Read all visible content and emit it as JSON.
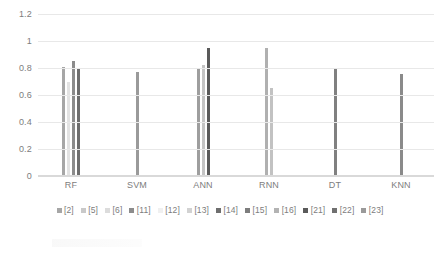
{
  "chart_data": {
    "type": "bar",
    "title": "",
    "subtitle": "",
    "xlabel": "",
    "ylabel": "",
    "categories": [
      "RF",
      "SVM",
      "ANN",
      "RNN",
      "DT",
      "KNN"
    ],
    "ylim": [
      0,
      1.2
    ],
    "yticks": [
      "0",
      "0.2",
      "0.4",
      "0.6",
      "0.8",
      "1",
      "1.2"
    ],
    "ytick_values": [
      0,
      0.2,
      0.4,
      0.6,
      0.8,
      1,
      1.2
    ],
    "grid": true,
    "legend_position": "bottom",
    "series": [
      {
        "name": "[2]",
        "color": "#a6a6a6",
        "values": [
          0.81,
          null,
          null,
          null,
          null,
          null
        ]
      },
      {
        "name": "[5]",
        "color": "#c9c9c9",
        "values": [
          null,
          null,
          null,
          null,
          null,
          null
        ]
      },
      {
        "name": "[6]",
        "color": "#d9d9d9",
        "values": [
          0.7,
          null,
          null,
          null,
          null,
          null
        ]
      },
      {
        "name": "[11]",
        "color": "#8c8c8c",
        "values": [
          0.85,
          null,
          null,
          null,
          null,
          null
        ]
      },
      {
        "name": "[12]",
        "color": "#efefef",
        "values": [
          null,
          null,
          null,
          null,
          null,
          null
        ]
      },
      {
        "name": "[13]",
        "color": "#bfbfbf",
        "values": [
          null,
          null,
          0.79,
          null,
          null,
          null
        ]
      },
      {
        "name": "[14]",
        "color": "#6e6e6e",
        "values": [
          0.79,
          null,
          null,
          null,
          null,
          null
        ]
      },
      {
        "name": "[15]",
        "color": "#9a9a9a",
        "values": [
          null,
          0.77,
          null,
          null,
          null,
          null
        ]
      },
      {
        "name": "[16]",
        "color": "#b3b3b3",
        "values": [
          null,
          null,
          0.82,
          null,
          null,
          null
        ]
      },
      {
        "name": "[21]",
        "color": "#5a5a5a",
        "values": [
          null,
          null,
          0.95,
          null,
          null,
          null
        ]
      },
      {
        "name": "[22]",
        "color": "#808080",
        "values": [
          null,
          null,
          null,
          0.95,
          0.8,
          null
        ]
      },
      {
        "name": "[23]",
        "color": "#aaaaaa",
        "values": [
          null,
          null,
          null,
          0.655,
          null,
          0.755
        ]
      }
    ],
    "bars": [
      {
        "category": "RF",
        "series": "[2]",
        "value": 0.81,
        "color": "#a6a6a6"
      },
      {
        "category": "RF",
        "series": "[6]",
        "value": 0.7,
        "color": "#e2e2e2"
      },
      {
        "category": "RF",
        "series": "[11]",
        "value": 0.85,
        "color": "#8c8c8c"
      },
      {
        "category": "RF",
        "series": "[14]",
        "value": 0.79,
        "color": "#6e6e6e"
      },
      {
        "category": "SVM",
        "series": "[15]",
        "value": 0.77,
        "color": "#9a9a9a"
      },
      {
        "category": "ANN",
        "series": "[13]",
        "value": 0.79,
        "color": "#9e9e9e"
      },
      {
        "category": "ANN",
        "series": "[16]",
        "value": 0.82,
        "color": "#c4c4c4"
      },
      {
        "category": "ANN",
        "series": "[21]",
        "value": 0.95,
        "color": "#5a5a5a"
      },
      {
        "category": "RNN",
        "series": "[22]",
        "value": 0.95,
        "color": "#b0b0b0"
      },
      {
        "category": "RNN",
        "series": "[23]",
        "value": 0.655,
        "color": "#c2c2c2"
      },
      {
        "category": "DT",
        "series": "[22]",
        "value": 0.8,
        "color": "#808080"
      },
      {
        "category": "KNN",
        "series": "[23]",
        "value": 0.755,
        "color": "#8a8a8a"
      }
    ],
    "legend": [
      {
        "label": "[2]",
        "color": "#a6a6a6"
      },
      {
        "label": "[5]",
        "color": "#c9c9c9"
      },
      {
        "label": "[6]",
        "color": "#dcdcdc"
      },
      {
        "label": "[11]",
        "color": "#8c8c8c"
      },
      {
        "label": "[12]",
        "color": "#f0f0f0"
      },
      {
        "label": "[13]",
        "color": "#d2d2d2"
      },
      {
        "label": "[14]",
        "color": "#6e6e6e"
      },
      {
        "label": "[15]",
        "color": "#7d7d7d"
      },
      {
        "label": "[16]",
        "color": "#b3b3b3"
      },
      {
        "label": "[21]",
        "color": "#5a5a5a"
      },
      {
        "label": "[22]",
        "color": "#707070"
      },
      {
        "label": "[23]",
        "color": "#9a9a9a"
      }
    ]
  }
}
